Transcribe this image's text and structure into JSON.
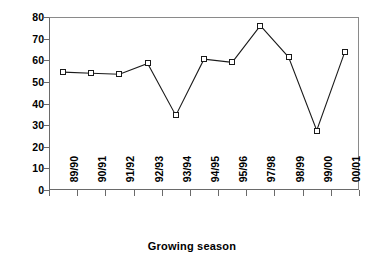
{
  "chart_data": {
    "type": "line",
    "title": "",
    "xlabel": "Growing season",
    "ylabel": "Relative Yield %",
    "categories": [
      "89/90",
      "90/91",
      "91/92",
      "92/93",
      "93/94",
      "94/95",
      "95/96",
      "97/98",
      "98/99",
      "99/00",
      "00/01"
    ],
    "values": [
      54.5,
      54,
      53.5,
      58.5,
      34.5,
      60.5,
      59,
      76,
      61.5,
      27.5,
      64
    ],
    "series": [
      {
        "name": "Relative Yield %",
        "values": [
          54.5,
          54,
          53.5,
          58.5,
          34.5,
          60.5,
          59,
          76,
          61.5,
          27.5,
          64
        ]
      }
    ],
    "ylim": [
      0,
      80
    ],
    "yticks": [
      0,
      10,
      20,
      30,
      40,
      50,
      60,
      70,
      80
    ],
    "ytick_labels": [
      "0",
      "10",
      "20",
      "30",
      "40",
      "50",
      "60",
      "70",
      "80"
    ],
    "grid": false,
    "legend": "none",
    "marker": "open-square",
    "line_color": "#1a1a1a",
    "marker_fill": "#ffffff",
    "marker_edge": "#1a1a1a",
    "background": "#ffffff"
  }
}
